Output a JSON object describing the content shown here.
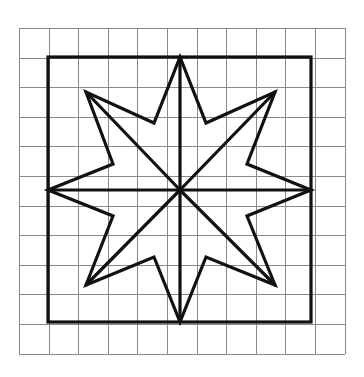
{
  "figure": {
    "title": "Eight-pointed star inscribed in a square on graph paper",
    "background_color": "#ffffff",
    "ink_color": "#111111",
    "grid_color": "#8a8a8a"
  },
  "grid": {
    "name": "graph-paper-grid",
    "columns": 11,
    "rows": 11,
    "cell_size_px": 29.6,
    "origin_x": 19,
    "origin_y": 28,
    "line_width_px": 1,
    "color": "#8a8a8a"
  },
  "frame": {
    "name": "bold-square-border",
    "x": 48,
    "y": 57,
    "width": 263,
    "height": 265,
    "line_width_px": 3.2,
    "color": "#111111",
    "span_cells": 9
  },
  "star": {
    "name": "eight-pointed-star",
    "points": 8,
    "center_x": 180,
    "center_y": 190,
    "outer_radius_px": 133,
    "inner_radius_px": 68,
    "line_width_px": 3.2,
    "color": "#111111",
    "outer_vertices": [
      {
        "label": "top",
        "x": 180,
        "y": 57
      },
      {
        "label": "upper-right",
        "x": 275,
        "y": 92
      },
      {
        "label": "right",
        "x": 311,
        "y": 190
      },
      {
        "label": "lower-right",
        "x": 275,
        "y": 285
      },
      {
        "label": "bottom",
        "x": 180,
        "y": 322
      },
      {
        "label": "lower-left",
        "x": 86,
        "y": 285
      },
      {
        "label": "left",
        "x": 48,
        "y": 190
      },
      {
        "label": "upper-left",
        "x": 86,
        "y": 92
      }
    ],
    "inner_vertices": [
      {
        "label": "n-ne",
        "x": 206,
        "y": 123
      },
      {
        "label": "ne-e",
        "x": 247,
        "y": 164
      },
      {
        "label": "e-se",
        "x": 247,
        "y": 216
      },
      {
        "label": "se-s",
        "x": 206,
        "y": 257
      },
      {
        "label": "s-sw",
        "x": 154,
        "y": 257
      },
      {
        "label": "sw-w",
        "x": 113,
        "y": 216
      },
      {
        "label": "w-nw",
        "x": 113,
        "y": 164
      },
      {
        "label": "nw-n",
        "x": 154,
        "y": 123
      }
    ],
    "spokes_from_center": 8,
    "spoke_targets": [
      "top",
      "upper-right",
      "right",
      "lower-right",
      "bottom",
      "lower-left",
      "left",
      "upper-left"
    ]
  }
}
